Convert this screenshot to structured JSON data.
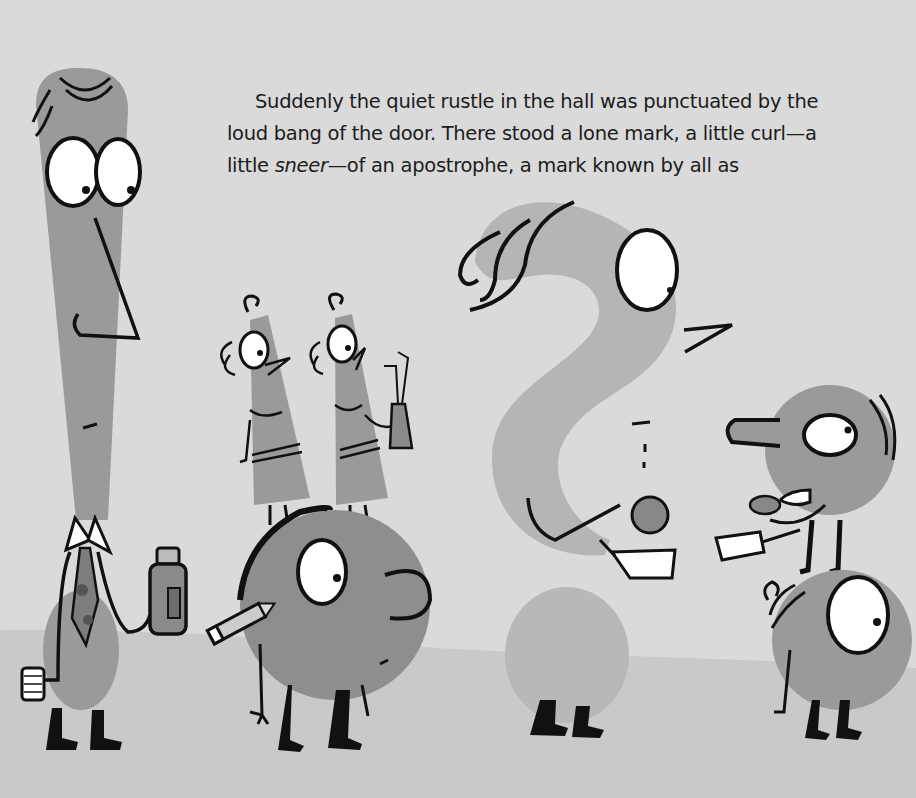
{
  "story": {
    "line1": "Suddenly the quiet rustle in the hall was punctuated by the",
    "line2": "loud bang of the door. There stood a lone mark, a little curl—a",
    "line3_before": "little ",
    "line3_emphasis": "sneer",
    "line3_after": "—of an apostrophe, a mark known by all as"
  },
  "scene": {
    "background_color": "#dadada",
    "floor_color": "#c9c9c9",
    "character_body_color": "#9a9a9a",
    "question_mark_color": "#b5b5b5",
    "characters": [
      "exclamation-mark-character",
      "twin-semicolon-characters",
      "period-character-with-pencil",
      "question-mark-character",
      "colon-stack-characters"
    ]
  }
}
